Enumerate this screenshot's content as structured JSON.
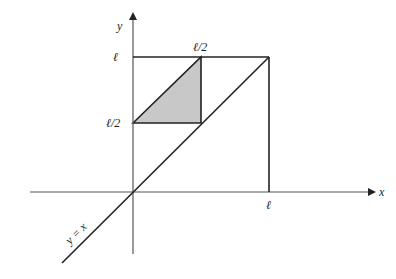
{
  "diagram": {
    "axes": {
      "x_label": "x",
      "y_label": "y"
    },
    "ticks": {
      "y_ell": "ℓ",
      "y_half": "ℓ/2",
      "x_ell": "ℓ",
      "top_half": "ℓ/2"
    },
    "line_label": "y = x",
    "colors": {
      "stroke": "#222222",
      "axis": "#555555",
      "shade": "#c8c8c8"
    },
    "shaded_region": {
      "vertices": [
        "(0, ℓ/2)",
        "(ℓ/2, ℓ)",
        "(ℓ/2, ℓ/2)"
      ]
    }
  }
}
